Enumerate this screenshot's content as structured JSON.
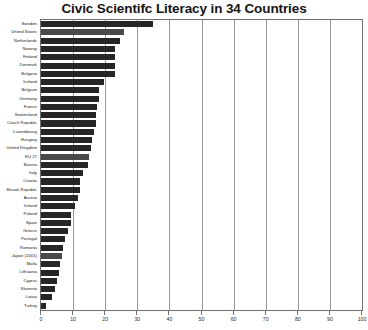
{
  "chart_data": {
    "type": "bar",
    "orientation": "horizontal",
    "title": "Civic Scientifc Literacy in 34 Countries",
    "xlabel": "",
    "ylabel": "",
    "xlim": [
      0,
      100
    ],
    "xticks": [
      0,
      10,
      20,
      30,
      40,
      50,
      60,
      70,
      80,
      90,
      100
    ],
    "grid": true,
    "legend": "none",
    "categories": [
      "Sweden",
      "United States",
      "Netherlands",
      "Norway",
      "Finland",
      "Denmark",
      "Bulgaria",
      "Iceland",
      "Belgium",
      "Germany",
      "France",
      "Switzerland",
      "Czech Republic",
      "Luxembourg",
      "Hungary",
      "United Kingdom",
      "EU 27",
      "Bosnia",
      "Italy",
      "Croatia",
      "Slovak Republic",
      "Austria",
      "Ireland",
      "Poland",
      "Spain",
      "Greece",
      "Portugal",
      "Romania",
      "Japan (2001)",
      "Malta",
      "Lithuania",
      "Cyprus",
      "Slovenia",
      "Latvia",
      "Turkey"
    ],
    "values": [
      35,
      26,
      24.5,
      23,
      23,
      23,
      23,
      19.5,
      18,
      18,
      17.5,
      17,
      17,
      16.5,
      16,
      15.5,
      15,
      14.5,
      13,
      12,
      12,
      11.5,
      10.5,
      9.5,
      9.5,
      8.5,
      7.5,
      7,
      6.5,
      6,
      5.5,
      5,
      4.5,
      3.5,
      1.5
    ],
    "highlighted_categories": [
      "United States",
      "EU 27",
      "Japan (2001)"
    ],
    "bar_color": "#262626",
    "highlight_bar_color": "#4a4a4a",
    "gridline_color": "#9a9a9a",
    "axis_color": "#6f6f6f"
  }
}
